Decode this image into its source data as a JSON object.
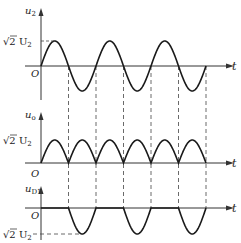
{
  "diagram": {
    "time_label": "t",
    "origin_label": "O",
    "peak_label": "√2 U",
    "peak_subscript": "2",
    "colors": {
      "stroke": "#1a1a1a",
      "axis": "#333333",
      "dash": "#444444"
    },
    "geometry": {
      "x0": 41,
      "half_period": 27.5,
      "half_cycles": 6,
      "axis_left": 25,
      "axis_right": 228,
      "amplitude_px": 25
    },
    "panels": [
      {
        "id": "u2",
        "symbol": "u",
        "subscript": "2",
        "zero_y": 66,
        "axis_top": 8,
        "axis_bottom": 100,
        "wave": "sine"
      },
      {
        "id": "u0",
        "symbol": "u",
        "subscript": "o",
        "zero_y": 163,
        "axis_top": 112,
        "axis_bottom": 163,
        "wave": "abs_sine",
        "amplitude_px": 23
      },
      {
        "id": "uD1",
        "symbol": "u",
        "subscript": "D1",
        "zero_y": 208,
        "axis_top": 186,
        "axis_bottom": 240,
        "wave": "neg_half",
        "amplitude_px": 26
      }
    ]
  }
}
